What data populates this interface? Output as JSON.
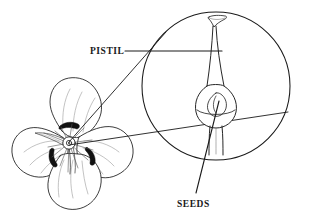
{
  "figure": {
    "kind": "botanical-line-diagram",
    "background_color": "#ffffff",
    "line_color": "#1a1a1a",
    "petal_shading_color": "#8a8a8a"
  },
  "labels": {
    "pistil": "PISTIL",
    "seeds": "SEEDS"
  },
  "callouts": [
    {
      "name": "pistil",
      "label": "PISTIL",
      "label_x": 90,
      "label_y": 54,
      "leader": {
        "x1": 125,
        "y1": 51,
        "x2": 222,
        "y2": 51
      }
    },
    {
      "name": "seeds",
      "label": "SEEDS",
      "label_x": 177,
      "label_y": 207,
      "leader": {
        "x1": 196,
        "y1": 193,
        "x2": 219,
        "y2": 101
      }
    }
  ],
  "magnifier": {
    "name": "detail-circle",
    "center_x": 216,
    "center_y": 86,
    "radius": 74,
    "connector_upper": {
      "x1": 69,
      "y1": 142,
      "x2": 166,
      "y2": 32
    },
    "connector_lower": {
      "x1": 69,
      "y1": 145,
      "x2": 288,
      "y2": 112
    }
  },
  "flower": {
    "name": "flower-illustration",
    "center_x": 69,
    "center_y": 143,
    "petal_count": 4,
    "dark_center": true
  },
  "pistil_detail": {
    "stigma": "funnel-shaped top",
    "style": "slender tapering column",
    "ovary": "swollen base containing seeds",
    "seed_count": 1,
    "filaments": "two descending strands"
  }
}
